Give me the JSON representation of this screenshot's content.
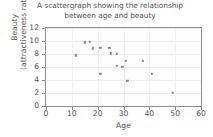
{
  "chart_data": {
    "type": "scatter",
    "title": "A scattergraph showing the relationship between age and beauty",
    "title_lines": [
      "A scattergraph showing the relationship",
      "between age and beauty"
    ],
    "xlabel": "Age",
    "ylabel": "Beauty (attractiveness rating)",
    "ylabel_lines": [
      "Beauty",
      "(attractiveness rating)"
    ],
    "xlim": [
      0,
      60
    ],
    "ylim": [
      0,
      12
    ],
    "xticks": [
      0,
      10,
      20,
      30,
      40,
      50,
      60
    ],
    "yticks": [
      0,
      2,
      4,
      6,
      8,
      10,
      12
    ],
    "grid": true,
    "legend": false,
    "marker_color": "#8a8a8a",
    "points": [
      {
        "x": 11.5,
        "y": 7.8
      },
      {
        "x": 15.0,
        "y": 9.8
      },
      {
        "x": 17.0,
        "y": 9.9
      },
      {
        "x": 18.0,
        "y": 8.9
      },
      {
        "x": 21.0,
        "y": 9.0
      },
      {
        "x": 21.0,
        "y": 5.0
      },
      {
        "x": 24.5,
        "y": 9.0
      },
      {
        "x": 25.0,
        "y": 8.1
      },
      {
        "x": 27.5,
        "y": 8.0
      },
      {
        "x": 27.5,
        "y": 6.2
      },
      {
        "x": 29.5,
        "y": 6.0
      },
      {
        "x": 31.0,
        "y": 7.0
      },
      {
        "x": 31.5,
        "y": 3.9
      },
      {
        "x": 37.5,
        "y": 7.0
      },
      {
        "x": 41.0,
        "y": 5.0
      },
      {
        "x": 49.0,
        "y": 2.0
      }
    ]
  }
}
